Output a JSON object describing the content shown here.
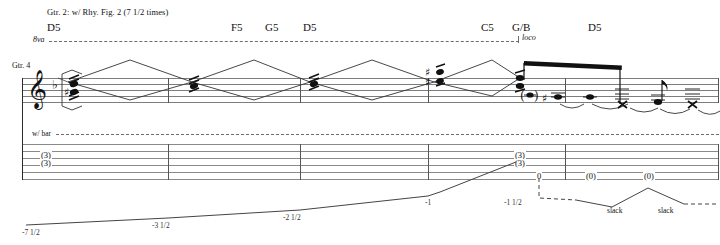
{
  "page": {
    "width": 720,
    "height": 245,
    "background": "#ffffff",
    "ink": "#111111"
  },
  "performance_notes": {
    "rhythm_cue": "Gtr. 2: w/ Rhy. Fig. 2 (7 1/2 times)",
    "guitar_label": "Gtr. 4",
    "whammy_label": "w/ bar"
  },
  "octave_markings": {
    "ottava_label": "8va",
    "loco_label": "loco"
  },
  "chords": [
    {
      "name": "D5",
      "x": 47
    },
    {
      "name": "F5",
      "x": 231
    },
    {
      "name": "G5",
      "x": 265
    },
    {
      "name": "D5",
      "x": 303
    },
    {
      "name": "C5",
      "x": 481
    },
    {
      "name": "G/B",
      "x": 514
    },
    {
      "name": "D5",
      "x": 588
    }
  ],
  "staff": {
    "clef": "treble-clef",
    "clef_glyph": "𝄞",
    "key_signature": "♭",
    "barlines_x": [
      168,
      300,
      428,
      565,
      719
    ]
  },
  "tab_staff": {
    "string_count": 6,
    "barlines_x": [
      168,
      300,
      428,
      565,
      719
    ],
    "entries": [
      {
        "fret": "(3)",
        "x": 45,
        "y": 155,
        "label": "tab-chord-3-3-upper"
      },
      {
        "fret": "(3)",
        "x": 45,
        "y": 163,
        "label": "tab-chord-3-3-lower"
      },
      {
        "fret": "(3)",
        "x": 519,
        "y": 155,
        "label": "tab-chord-3-3-upper-2"
      },
      {
        "fret": "(3)",
        "x": 519,
        "y": 163,
        "label": "tab-chord-3-3-lower-2"
      },
      {
        "fret": "0",
        "x": 539,
        "y": 176,
        "label": "tab-open-string"
      },
      {
        "fret": "(0)",
        "x": 590,
        "y": 176,
        "label": "tab-ghost-open-1"
      },
      {
        "fret": "(0)",
        "x": 648,
        "y": 176,
        "label": "tab-ghost-open-2"
      }
    ]
  },
  "whammy_bar": {
    "values": [
      {
        "text": "-7 1/2",
        "x": 40,
        "y": 233
      },
      {
        "text": "-3 1/2",
        "x": 168,
        "y": 226
      },
      {
        "text": "-2 1/2",
        "x": 298,
        "y": 218
      },
      {
        "text": "-1",
        "x": 432,
        "y": 203
      },
      {
        "text": "-1 1/2",
        "x": 511,
        "y": 203
      }
    ],
    "slack_labels": [
      {
        "text": "slack",
        "x": 612,
        "y": 211
      },
      {
        "text": "slack",
        "x": 662,
        "y": 211
      }
    ]
  },
  "colors": {
    "staff_line": "#7d7d7d",
    "tab_line": "#8a8a8a",
    "barline": "#555555",
    "note": "#111111",
    "bend_line": "#444444",
    "dashed": "#6d6d6d"
  }
}
